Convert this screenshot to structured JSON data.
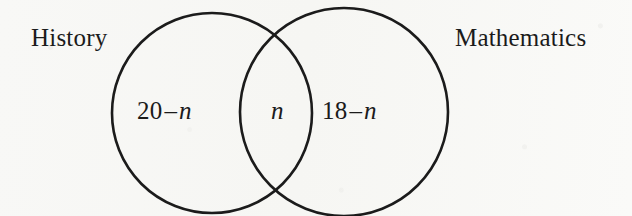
{
  "figure": {
    "type": "venn-diagram",
    "background_color": "#f8f8f6",
    "ink_color": "#1b1b1b",
    "sets": [
      {
        "id": "history",
        "label": "History",
        "label_position": "outside-left",
        "total_expression": "20"
      },
      {
        "id": "mathematics",
        "label": "Mathematics",
        "label_position": "outside-right",
        "total_expression": "18"
      }
    ],
    "regions": [
      {
        "id": "left-only",
        "text": "20 – n",
        "number": "20",
        "operator": "–",
        "variable": "n",
        "belongs_to": "history"
      },
      {
        "id": "intersection",
        "text": "n",
        "variable": "n",
        "belongs_to": "history-and-mathematics"
      },
      {
        "id": "right-only",
        "text": "18 – n",
        "number": "18",
        "operator": "–",
        "variable": "n",
        "belongs_to": "mathematics"
      }
    ],
    "geometry": {
      "left_circle": {
        "cx": 212,
        "cy": 113,
        "r": 100,
        "stroke_width": 2.6
      },
      "right_circle": {
        "cx": 344,
        "cy": 112,
        "r": 104,
        "stroke_width": 2.6
      },
      "intersection_points": [
        {
          "x": 282,
          "y": 42
        },
        {
          "x": 288,
          "y": 185
        }
      ]
    }
  }
}
